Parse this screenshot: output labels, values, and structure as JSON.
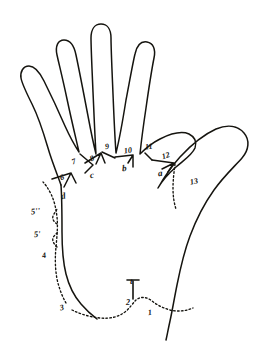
{
  "figure": {
    "ink_color": "#15140f",
    "background_color": "#ffffff"
  },
  "labels": [
    {
      "id": "label-1",
      "text": "1",
      "kind": "digit",
      "x": 148,
      "y": 309,
      "rotate": -8
    },
    {
      "id": "label-2",
      "text": "2",
      "kind": "digit",
      "x": 126,
      "y": 299,
      "rotate": 0
    },
    {
      "id": "label-t",
      "text": "t",
      "kind": "letter",
      "x": 130,
      "y": 277,
      "rotate": 0
    },
    {
      "id": "label-3",
      "text": "3",
      "kind": "digit",
      "x": 60,
      "y": 304,
      "rotate": -14
    },
    {
      "id": "label-4",
      "text": "4",
      "kind": "digit",
      "x": 42,
      "y": 252,
      "rotate": -10
    },
    {
      "id": "label-5p",
      "text": "5'",
      "kind": "prime",
      "x": 34,
      "y": 230,
      "rotate": -6
    },
    {
      "id": "label-5pp",
      "text": "5''",
      "kind": "prime",
      "x": 31,
      "y": 207,
      "rotate": -6
    },
    {
      "id": "label-6",
      "text": "6",
      "kind": "digit",
      "x": 60,
      "y": 174,
      "rotate": -22
    },
    {
      "id": "label-d",
      "text": "d",
      "kind": "letter",
      "x": 61,
      "y": 192,
      "rotate": -10
    },
    {
      "id": "label-7",
      "text": "7",
      "kind": "digit",
      "x": 72,
      "y": 158,
      "rotate": -20
    },
    {
      "id": "label-8",
      "text": "8",
      "kind": "digit",
      "x": 90,
      "y": 155,
      "rotate": -22
    },
    {
      "id": "label-c",
      "text": "c",
      "kind": "letter",
      "x": 90,
      "y": 171,
      "rotate": -8
    },
    {
      "id": "label-9",
      "text": "9",
      "kind": "digit",
      "x": 105,
      "y": 143,
      "rotate": -10
    },
    {
      "id": "label-10",
      "text": "10",
      "kind": "digit",
      "x": 124,
      "y": 147,
      "rotate": -8
    },
    {
      "id": "label-b",
      "text": "b",
      "kind": "letter",
      "x": 122,
      "y": 164,
      "rotate": -4
    },
    {
      "id": "label-11",
      "text": "11",
      "kind": "digit",
      "x": 145,
      "y": 143,
      "rotate": -6
    },
    {
      "id": "label-12",
      "text": "12",
      "kind": "digit",
      "x": 162,
      "y": 152,
      "rotate": -18
    },
    {
      "id": "label-a",
      "text": "a",
      "kind": "letter",
      "x": 158,
      "y": 169,
      "rotate": -6
    },
    {
      "id": "label-13",
      "text": "13",
      "kind": "digit",
      "x": 190,
      "y": 178,
      "rotate": -12
    }
  ],
  "paths": {
    "hand_outline": "M 61,185 C 58,176 52,162 48,148 C 43,131 38,116 32,104 C 26,92 22,84 21,78 C 20,72 23,66 29,66 C 34,66 39,71 44,81 C 50,93 58,110 65,126 C 70,137 75,146 79,152 C 76,139 71,118 67,99 C 63,80 59,64 57,55 C 55,46 58,40 64,40 C 70,40 74,45 76,55 C 79,69 84,95 88,116 C 91,132 94,146 96,154 C 95,139 94,114 93,92 C 92,68 91,48 91,38 C 91,29 95,24 101,24 C 107,24 111,29 111,38 C 111,48 112,70 113,94 C 114,118 115,140 116,153 C 119,141 123,119 126,100 C 130,79 133,62 135,54 C 137,45 141,41 147,42 C 153,43 156,49 154,58 C 152,68 149,87 146,108 C 143,128 141,144 140,154 C 145,149 152,143 160,139 C 172,133 182,131 189,134 C 195,137 197,142 195,148 C 192,155 184,160 176,167 C 168,174 162,181 158,188 C 162,181 170,168 180,157 C 192,144 205,134 216,129 C 228,124 238,126 244,133 C 250,140 249,150 242,158 C 235,166 224,176 214,190 C 204,204 196,220 190,236 C 184,252 180,270 177,285 C 174,300 172,312 170,321 C 168,330 167,336 166,340",
    "palm_left_border": "M 61,185 C 62,200 62,216 62,232 C 62,248 63,262 66,274 C 69,286 74,296 81,304 C 87,311 93,316 97,319",
    "crease_thenar_wrist": "M 72,310 C 80,314 90,317 100,318 C 110,319 118,317 125,312 C 130,308 133,303 136,300 C 141,296 147,297 152,301 C 157,305 163,308 170,310 C 178,312 186,311 193,308",
    "crease_t_stem": "M 133,299 L 133,281",
    "crease_t_bar": "M 127,280 L 139,280",
    "crease_ulnar": "M 66,303 C 62,296 59,288 57,279 C 55,268 55,257 56,247 C 57,236 58,226 57,217 C 56,208 54,200 51,194 C 48,188 45,184 43,182",
    "crease_ulnar_squiggle_a": "M 57,247 C 54,244 52,241 53,238 C 54,235 57,234 58,231",
    "crease_ulnar_squiggle_b": "M 57,224 C 54,222 52,219 53,216 C 54,213 57,211 57,208",
    "crease_thumb_web": "M 175,164 C 174,172 173,180 173,188 C 173,196 174,203 176,209",
    "marker_6": "M 52,179 L 71,173 M 71,173 L 76,183 M 71,173 L 64,187",
    "marker_7": "M 80,154 L 93,165 M 93,165 L 85,173",
    "marker_8": "M 85,163 L 101,153 M 101,153 L 105,163 M 101,153 L 96,164",
    "marker_9": "M 102,152 L 115,158",
    "marker_10": "M 115,157 L 133,155 M 133,155 L 133,167 M 133,155 L 128,163",
    "marker_11": "M 145,153 L 152,160",
    "marker_12": "M 152,160 L 174,163 M 174,163 L 168,172 M 174,163 L 162,169",
    "marker_a_tick": "M 166,163 L 170,172"
  }
}
